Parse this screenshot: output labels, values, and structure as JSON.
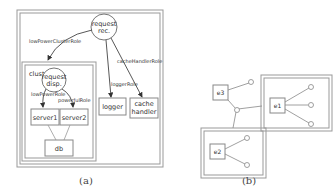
{
  "figure_a": {
    "caption": "(a)",
    "container": {
      "name": "outer-system"
    },
    "cluster": {
      "label": "clusterA"
    },
    "nodes": {
      "request_rec": {
        "line1": "request",
        "line2": "rec."
      },
      "request_disp": {
        "line1": "request",
        "line2": "disp."
      },
      "server1": {
        "label": "server1"
      },
      "server2": {
        "label": "server2"
      },
      "db": {
        "label": "db"
      },
      "logger": {
        "label": "logger"
      },
      "cache_handler": {
        "line1": "cache",
        "line2": "handler"
      }
    },
    "edges": {
      "low_power_cluster_role": "lowPowerClusterRole",
      "cache_handler_role": "cacheHandlerRole",
      "logger_role": "loggerRole",
      "low_power_role": "lowPowerRole",
      "powerful_role": "powerfulRole"
    }
  },
  "figure_b": {
    "caption": "(b)",
    "nodes": {
      "e1": {
        "label": "e1"
      },
      "e2": {
        "label": "e2"
      },
      "e3": {
        "label": "e3"
      }
    }
  },
  "colors": {
    "stroke": "#666666",
    "box_stroke": "#888888",
    "text": "#333333"
  }
}
